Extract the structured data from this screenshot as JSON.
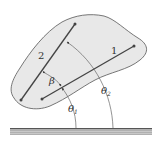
{
  "diagram": {
    "type": "rigid-body-lines-angles",
    "colors": {
      "body_fill": "#e8e8e8",
      "body_stroke": "#555555",
      "line": "#444444",
      "ground": "#999999"
    },
    "labels": {
      "line1": "1",
      "line2": "2",
      "beta": "β",
      "theta1": "θ",
      "theta1_sub": "1",
      "theta2": "θ",
      "theta2_sub": "2"
    }
  }
}
